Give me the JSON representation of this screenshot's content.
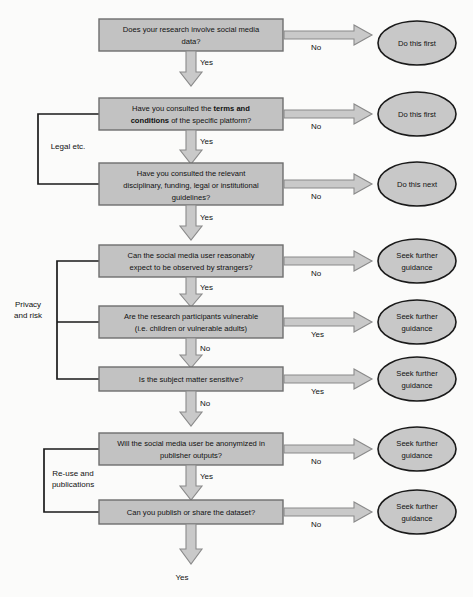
{
  "figure": {
    "type": "flowchart",
    "background_color": "#fbfbfa",
    "box_fill": "#c2c2c2",
    "box_stroke": "#6e6e6e",
    "ellipse_fill": "#c8c8c8",
    "ellipse_stroke": "#1a1a1a",
    "arrow_fill": "#c9c9c9",
    "arrow_stroke": "#8a8a8a",
    "line_color": "#1a1a1a"
  },
  "decisions": [
    {
      "id": "d1",
      "lines": [
        "Does your research involve social media",
        "data?"
      ],
      "bold_segments": []
    },
    {
      "id": "d2",
      "lines": [
        "Have you consulted the terms and",
        "conditions of the specific platform?"
      ],
      "bold_segments": [
        "terms and",
        "conditions"
      ]
    },
    {
      "id": "d3",
      "lines": [
        "Have you consulted the relevant",
        "disciplinary, funding, legal or institutional",
        "guidelines?"
      ],
      "bold_segments": []
    },
    {
      "id": "d4",
      "lines": [
        "Can the social media user reasonably",
        "expect to be observed by strangers?"
      ],
      "bold_segments": []
    },
    {
      "id": "d5",
      "lines": [
        "Are the research participants vulnerable",
        "(i.e. children or vulnerable adults)"
      ],
      "bold_segments": []
    },
    {
      "id": "d6",
      "lines": [
        "Is the subject matter sensitive?"
      ],
      "bold_segments": []
    },
    {
      "id": "d7",
      "lines": [
        "Will the social media user be anonymized in",
        "publisher outputs?"
      ],
      "bold_segments": []
    },
    {
      "id": "d8",
      "lines": [
        "Can you publish or share the dataset?"
      ],
      "bold_segments": []
    }
  ],
  "outcomes": [
    {
      "id": "o1",
      "lines": [
        "Do this first"
      ]
    },
    {
      "id": "o2",
      "lines": [
        "Do this first"
      ]
    },
    {
      "id": "o3",
      "lines": [
        "Do this next"
      ]
    },
    {
      "id": "o4",
      "lines": [
        "Seek further",
        "guidance"
      ]
    },
    {
      "id": "o5",
      "lines": [
        "Seek further",
        "guidance"
      ]
    },
    {
      "id": "o6",
      "lines": [
        "Seek further",
        "guidance"
      ]
    },
    {
      "id": "o7",
      "lines": [
        "Seek further",
        "guidance"
      ]
    },
    {
      "id": "o8",
      "lines": [
        "Seek further",
        "guidance"
      ]
    }
  ],
  "branch_labels": {
    "d1_right": "No",
    "d1_down": "Yes",
    "d2_right": "No",
    "d2_down": "Yes",
    "d3_right": "No",
    "d3_down": "Yes",
    "d4_right": "No",
    "d4_down": "Yes",
    "d5_right": "Yes",
    "d5_down": "No",
    "d6_right": "Yes",
    "d6_down": "No",
    "d7_right": "No",
    "d7_down": "Yes",
    "d8_right": "No",
    "d8_down": "Yes"
  },
  "group_labels": [
    {
      "id": "g1",
      "lines": [
        "Legal etc."
      ]
    },
    {
      "id": "g2",
      "lines": [
        "Privacy",
        "and risk"
      ]
    },
    {
      "id": "g3",
      "lines": [
        "Re-use and",
        "publications"
      ]
    }
  ]
}
